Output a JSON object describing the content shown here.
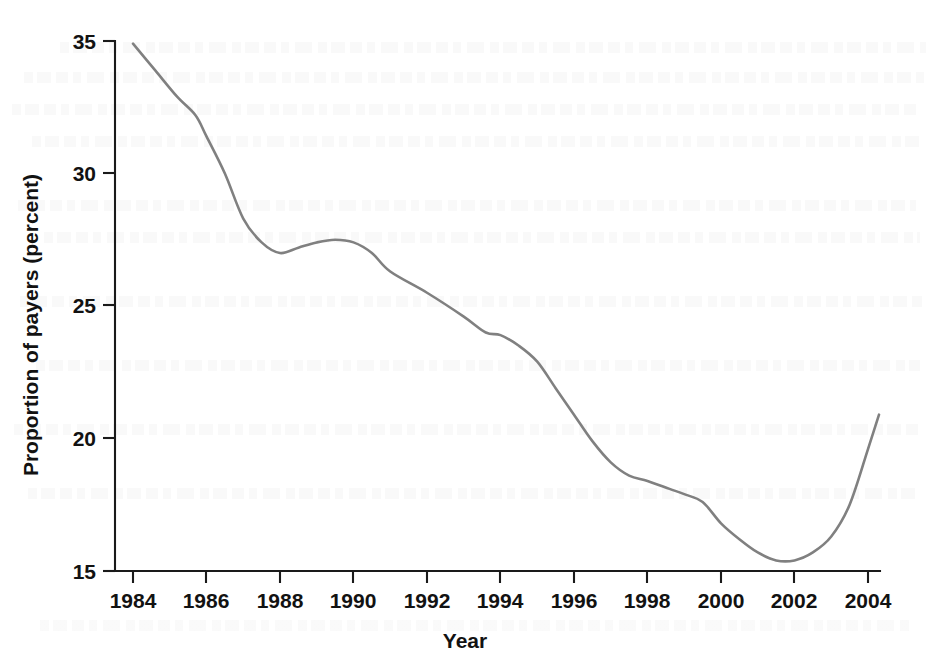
{
  "chart_data": {
    "type": "line",
    "title": "",
    "xlabel": "Year",
    "ylabel": "Proportion of payers (percent)",
    "xlim": [
      1983.4,
      2004.6
    ],
    "ylim": [
      15,
      35
    ],
    "xticks": [
      1984,
      1986,
      1988,
      1990,
      1992,
      1994,
      1996,
      1998,
      2000,
      2002,
      2004
    ],
    "xtick_labels": [
      "1984",
      "1986",
      "1988",
      "1990",
      "1992",
      "1994",
      "1996",
      "1998",
      "2000",
      "2002",
      "2004"
    ],
    "yticks": [
      15,
      20,
      25,
      30,
      35
    ],
    "ytick_labels": [
      "15",
      "20",
      "25",
      "30",
      "35"
    ],
    "grid": false,
    "legend": null,
    "line_color": "#808080",
    "axis_color": "#1a1a1a",
    "series": [
      {
        "name": "Proportion of payers",
        "x": [
          1984.0,
          1984.6,
          1985.2,
          1985.7,
          1986.0,
          1986.5,
          1987.0,
          1987.5,
          1988.0,
          1988.5,
          1989.0,
          1989.5,
          1990.0,
          1990.5,
          1991.0,
          1992.0,
          1993.0,
          1993.6,
          1994.0,
          1994.5,
          1995.0,
          1995.5,
          1996.0,
          1996.5,
          1997.0,
          1997.5,
          1998.0,
          1998.6,
          1999.0,
          1999.5,
          2000.0,
          2000.5,
          2001.0,
          2001.5,
          2002.0,
          2002.5,
          2003.0,
          2003.5,
          2004.0,
          2004.3
        ],
        "y": [
          34.9,
          33.9,
          32.9,
          32.2,
          31.4,
          30.0,
          28.3,
          27.4,
          27.0,
          27.2,
          27.4,
          27.5,
          27.4,
          27.0,
          26.3,
          25.5,
          24.6,
          24.0,
          23.9,
          23.5,
          22.9,
          21.9,
          20.9,
          19.9,
          19.1,
          18.6,
          18.4,
          18.1,
          17.9,
          17.6,
          16.8,
          16.2,
          15.7,
          15.4,
          15.4,
          15.7,
          16.3,
          17.5,
          19.6,
          20.9
        ]
      }
    ],
    "annotations": {
      "start_value": 34.9,
      "start_year": 1984,
      "local_min_1988": 27.0,
      "local_max_1989_5": 27.5,
      "shelf_1994": 23.9,
      "shelf_1999": 17.9,
      "global_min_value": 15.4,
      "global_min_year": 2001.5,
      "end_value": 20.9,
      "end_year": 2004.3
    }
  }
}
